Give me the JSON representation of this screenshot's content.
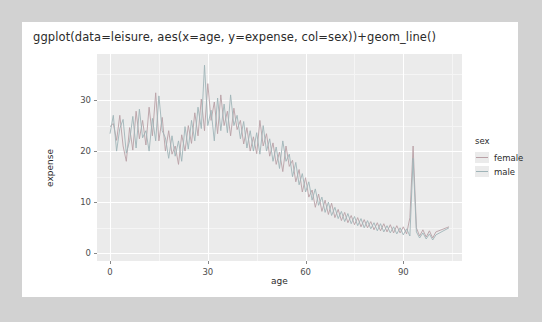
{
  "card": {
    "title": "ggplot(data=leisure, aes(x=age, y=expense, col=sex))+geom_line()"
  },
  "legend": {
    "title": "sex",
    "entries": [
      {
        "label": "female",
        "color": "#b9a0a6"
      },
      {
        "label": "male",
        "color": "#9fb4b8"
      }
    ]
  },
  "chart_data": {
    "type": "line",
    "title": "ggplot(data=leisure, aes(x=age, y=expense, col=sex))+geom_line()",
    "xlabel": "age",
    "ylabel": "expense",
    "xlim": [
      -4,
      108
    ],
    "ylim": [
      -1.5,
      39
    ],
    "xticks": [
      0,
      30,
      60,
      90
    ],
    "yticks": [
      0,
      10,
      20,
      30
    ],
    "grid": true,
    "legend_position": "right",
    "colors": {
      "female": "#b9a0a6",
      "male": "#9fb4b8"
    },
    "series": [
      {
        "name": "female",
        "x": [
          0,
          1,
          2,
          3,
          4,
          5,
          6,
          7,
          8,
          9,
          10,
          11,
          12,
          13,
          14,
          15,
          16,
          17,
          18,
          19,
          20,
          21,
          22,
          23,
          24,
          25,
          26,
          27,
          28,
          29,
          30,
          31,
          32,
          33,
          34,
          35,
          36,
          37,
          38,
          39,
          40,
          41,
          42,
          43,
          44,
          45,
          46,
          47,
          48,
          49,
          50,
          51,
          52,
          53,
          54,
          55,
          56,
          57,
          58,
          59,
          60,
          61,
          62,
          63,
          64,
          65,
          66,
          67,
          68,
          69,
          70,
          71,
          72,
          73,
          74,
          75,
          76,
          77,
          78,
          79,
          80,
          81,
          82,
          83,
          84,
          85,
          86,
          87,
          88,
          89,
          90,
          91,
          92,
          93,
          94,
          95,
          96,
          97,
          98,
          99,
          100,
          104
        ],
        "values": [
          24.8,
          25.4,
          22.1,
          27.0,
          21.0,
          18.0,
          24.6,
          20.2,
          27.8,
          22.4,
          26.0,
          21.2,
          28.6,
          23.0,
          31.4,
          22.0,
          26.6,
          20.0,
          24.0,
          19.4,
          21.0,
          17.4,
          23.2,
          20.0,
          25.0,
          21.5,
          27.5,
          23.0,
          30.2,
          24.0,
          33.2,
          26.0,
          29.6,
          23.4,
          31.0,
          25.0,
          27.8,
          23.0,
          28.4,
          24.2,
          26.0,
          21.4,
          24.6,
          20.0,
          22.8,
          19.5,
          26.0,
          21.0,
          23.4,
          19.0,
          21.6,
          17.4,
          19.8,
          16.0,
          21.0,
          17.0,
          18.2,
          14.0,
          16.4,
          12.0,
          14.8,
          11.0,
          12.4,
          9.0,
          11.6,
          8.2,
          10.4,
          7.6,
          9.8,
          7.0,
          8.6,
          6.4,
          8.0,
          6.0,
          7.4,
          5.6,
          7.0,
          5.2,
          6.6,
          5.0,
          6.2,
          4.6,
          6.0,
          4.4,
          5.8,
          4.2,
          5.6,
          4.0,
          5.4,
          4.0,
          5.2,
          3.8,
          7.0,
          21.0,
          5.0,
          3.4,
          4.6,
          3.2,
          4.4,
          3.0,
          4.2,
          5.2
        ]
      },
      {
        "name": "male",
        "x": [
          0,
          1,
          2,
          3,
          4,
          5,
          6,
          7,
          8,
          9,
          10,
          11,
          12,
          13,
          14,
          15,
          16,
          17,
          18,
          19,
          20,
          21,
          22,
          23,
          24,
          25,
          26,
          27,
          28,
          29,
          30,
          31,
          32,
          33,
          34,
          35,
          36,
          37,
          38,
          39,
          40,
          41,
          42,
          43,
          44,
          45,
          46,
          47,
          48,
          49,
          50,
          51,
          52,
          53,
          54,
          55,
          56,
          57,
          58,
          59,
          60,
          61,
          62,
          63,
          64,
          65,
          66,
          67,
          68,
          69,
          70,
          71,
          72,
          73,
          74,
          75,
          76,
          77,
          78,
          79,
          80,
          81,
          82,
          83,
          84,
          85,
          86,
          87,
          88,
          89,
          90,
          91,
          92,
          93,
          94,
          95,
          96,
          97,
          98,
          99,
          100,
          104
        ],
        "values": [
          23.4,
          27.0,
          20.0,
          24.4,
          26.2,
          19.6,
          22.0,
          26.8,
          20.6,
          28.2,
          22.6,
          24.0,
          20.0,
          26.4,
          22.0,
          30.8,
          24.0,
          22.6,
          18.6,
          23.0,
          19.0,
          22.0,
          18.0,
          24.8,
          20.4,
          26.0,
          22.0,
          28.6,
          24.4,
          36.8,
          25.0,
          28.0,
          22.0,
          30.4,
          24.0,
          29.2,
          23.6,
          31.0,
          25.0,
          27.0,
          22.4,
          25.8,
          20.6,
          24.0,
          20.0,
          23.6,
          19.4,
          25.0,
          20.0,
          22.4,
          18.0,
          20.8,
          16.6,
          22.0,
          18.0,
          19.4,
          15.0,
          17.8,
          13.4,
          15.6,
          12.0,
          14.0,
          10.4,
          12.6,
          9.4,
          11.0,
          8.0,
          10.0,
          7.4,
          9.0,
          6.8,
          8.2,
          6.2,
          7.8,
          5.8,
          7.2,
          5.4,
          6.8,
          5.0,
          6.4,
          4.8,
          6.0,
          4.4,
          5.8,
          4.2,
          5.4,
          4.0,
          5.2,
          3.8,
          5.0,
          3.6,
          4.8,
          3.4,
          18.6,
          4.2,
          3.0,
          4.0,
          2.8,
          3.8,
          2.6,
          3.6,
          5.0
        ]
      }
    ]
  }
}
